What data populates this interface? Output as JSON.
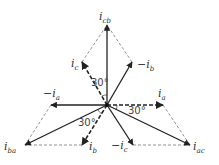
{
  "diagram": {
    "type": "phasor-diagram",
    "center": [
      107,
      105
    ],
    "solid_vectors": [
      {
        "name": "i_cb",
        "label": "i",
        "sub": "cb",
        "to": [
          107,
          25
        ],
        "label_pos": [
          99,
          20
        ]
      },
      {
        "name": "-i_b",
        "label": "−i",
        "sub": "b",
        "to": [
          132,
          62
        ],
        "label_pos": [
          137,
          68
        ]
      },
      {
        "name": "-i_a",
        "label": "−i",
        "sub": "a",
        "to": [
          51,
          105
        ],
        "label_pos": [
          43,
          97
        ]
      },
      {
        "name": "i_ba",
        "label": "i",
        "sub": "ba",
        "to": [
          25,
          145
        ],
        "label_pos": [
          4,
          150
        ]
      },
      {
        "name": "-i_c",
        "label": "−i",
        "sub": "c",
        "to": [
          133,
          145
        ],
        "label_pos": [
          111,
          149
        ]
      },
      {
        "name": "i_ac",
        "label": "i",
        "sub": "ac",
        "to": [
          190,
          145
        ],
        "label_pos": [
          193,
          150
        ]
      }
    ],
    "dashed_vectors": [
      {
        "name": "i_c",
        "label": "i",
        "sub": "c",
        "to": [
          82,
          62
        ],
        "label_pos": [
          71,
          67
        ]
      },
      {
        "name": "i_a",
        "label": "i",
        "sub": "a",
        "to": [
          163,
          105
        ],
        "label_pos": [
          158,
          97
        ]
      },
      {
        "name": "i_b",
        "label": "i",
        "sub": "b",
        "to": [
          82,
          145
        ],
        "label_pos": [
          89,
          150
        ]
      }
    ],
    "angles": [
      {
        "text": "30°",
        "pos": [
          91,
          86
        ]
      },
      {
        "text": "30°",
        "pos": [
          128,
          114
        ]
      },
      {
        "text": "30°",
        "pos": [
          78,
          126
        ]
      }
    ]
  }
}
